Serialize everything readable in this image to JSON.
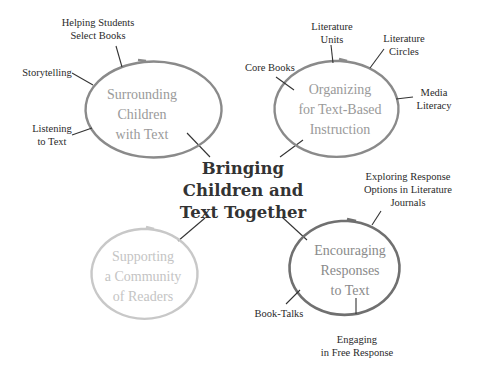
{
  "center": {
    "lines": [
      "Bringing",
      "Children and",
      "Text Together"
    ],
    "color": "#333333"
  },
  "hubs": [
    {
      "id": "surrounding",
      "lines": [
        "Surrounding",
        "Children",
        "with Text"
      ],
      "stroke": "#8a8a8a",
      "text_color": "#9a9a9a",
      "spokes": [
        {
          "lines": [
            "Helping Students",
            "Select Books"
          ]
        },
        {
          "lines": [
            "Storytelling"
          ]
        },
        {
          "lines": [
            "Listening",
            "to Text"
          ]
        }
      ]
    },
    {
      "id": "organizing",
      "lines": [
        "Organizing",
        "for Text-Based",
        "Instruction"
      ],
      "stroke": "#8a8a8a",
      "text_color": "#9a9a9a",
      "spokes": [
        {
          "lines": [
            "Literature",
            "Units"
          ]
        },
        {
          "lines": [
            "Literature",
            "Circles"
          ]
        },
        {
          "lines": [
            "Core Books"
          ]
        },
        {
          "lines": [
            "Media",
            "Literacy"
          ]
        }
      ]
    },
    {
      "id": "encouraging",
      "lines": [
        "Encouraging",
        "Responses",
        "to Text"
      ],
      "stroke": "#707070",
      "text_color": "#8a8a8a",
      "spokes": [
        {
          "lines": [
            "Exploring Response",
            "Options in Literature",
            "Journals"
          ]
        },
        {
          "lines": [
            "Book-Talks"
          ]
        },
        {
          "lines": [
            "Engaging",
            "in Free Response"
          ]
        }
      ]
    },
    {
      "id": "supporting",
      "lines": [
        "Supporting",
        "a Community",
        "of Readers"
      ],
      "stroke": "#c8c8c8",
      "text_color": "#c4c4c4",
      "spokes": []
    }
  ]
}
